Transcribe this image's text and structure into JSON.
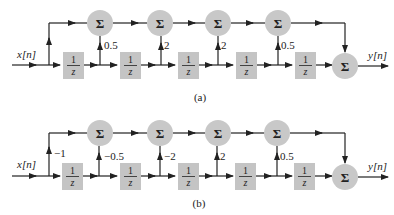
{
  "diagrams": [
    {
      "caption": "(a)",
      "input_label": "x[n]",
      "output_label": "y[n]",
      "sum_symbol": "Σ",
      "delay": {
        "num": "1",
        "den": "z"
      },
      "tap_gains": [
        "0.5",
        "2",
        "2",
        "0.5"
      ],
      "direct_gain": ""
    },
    {
      "caption": "(b)",
      "input_label": "x[n]",
      "output_label": "y[n]",
      "sum_symbol": "Σ",
      "delay": {
        "num": "1",
        "den": "z"
      },
      "tap_gains": [
        "−0.5",
        "−2",
        "2",
        "0.5"
      ],
      "direct_gain": "−1"
    }
  ],
  "colors": {
    "block_fill": "#c4c4c4",
    "summer_fill": "#c8c8c8",
    "wire": "#222222"
  }
}
